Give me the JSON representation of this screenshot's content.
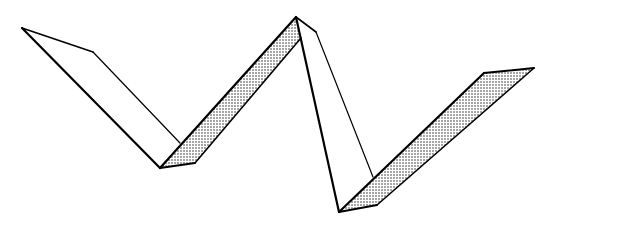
{
  "figure": {
    "width": 617,
    "height": 239,
    "colors": {
      "background": "#ffffff",
      "stroke": "#000000",
      "shade_dot": "#222222"
    },
    "segments": [
      {
        "id": "face-1",
        "shaded": false,
        "points": "22,28 93,52 180,143 160,168"
      },
      {
        "id": "face-2",
        "shaded": true,
        "points": "160,168 195,163 301,38 296,17"
      },
      {
        "id": "face-3",
        "shaded": false,
        "points": "296,17 316,32 373,177 339,212"
      },
      {
        "id": "face-4",
        "shaded": true,
        "points": "339,212 377,205 534,68 484,73"
      }
    ],
    "edges": [
      {
        "id": "outer-edge-1",
        "x1": 22,
        "y1": 28,
        "x2": 160,
        "y2": 168,
        "w": 2.2
      },
      {
        "id": "inner-edge-1",
        "x1": 93,
        "y1": 52,
        "x2": 180,
        "y2": 143,
        "w": 1.2
      },
      {
        "id": "top-edge-1",
        "x1": 22,
        "y1": 28,
        "x2": 93,
        "y2": 52,
        "w": 1.6
      },
      {
        "id": "outer-edge-2",
        "x1": 160,
        "y1": 168,
        "x2": 296,
        "y2": 17,
        "w": 2.2
      },
      {
        "id": "inner-edge-2",
        "x1": 195,
        "y1": 163,
        "x2": 301,
        "y2": 38,
        "w": 1.6
      },
      {
        "id": "bottom-edge-2",
        "x1": 160,
        "y1": 168,
        "x2": 195,
        "y2": 163,
        "w": 1.8
      },
      {
        "id": "outer-edge-3",
        "x1": 296,
        "y1": 17,
        "x2": 339,
        "y2": 212,
        "w": 2.2
      },
      {
        "id": "inner-edge-3",
        "x1": 316,
        "y1": 32,
        "x2": 373,
        "y2": 177,
        "w": 1.2
      },
      {
        "id": "top-edge-3",
        "x1": 296,
        "y1": 17,
        "x2": 316,
        "y2": 32,
        "w": 1.6
      },
      {
        "id": "outer-edge-4",
        "x1": 339,
        "y1": 212,
        "x2": 484,
        "y2": 73,
        "w": 2.2
      },
      {
        "id": "inner-edge-4",
        "x1": 377,
        "y1": 205,
        "x2": 534,
        "y2": 68,
        "w": 1.6
      },
      {
        "id": "bottom-edge-4",
        "x1": 339,
        "y1": 212,
        "x2": 377,
        "y2": 205,
        "w": 1.8
      },
      {
        "id": "top-edge-4",
        "x1": 484,
        "y1": 73,
        "x2": 534,
        "y2": 68,
        "w": 2.0
      }
    ]
  }
}
